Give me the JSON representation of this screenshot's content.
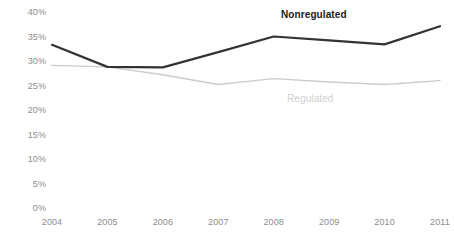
{
  "chart_data": {
    "type": "line",
    "title": "",
    "subtitle": "",
    "xlabel": "",
    "ylabel": "",
    "categories": [
      "2004",
      "2005",
      "2006",
      "2007",
      "2008",
      "2009",
      "2010",
      "2011"
    ],
    "x": [
      2004,
      2005,
      2006,
      2007,
      2008,
      2009,
      2010,
      2011
    ],
    "series": [
      {
        "name": "Nonregulated",
        "color": "#333333",
        "line_width": 2.2,
        "values": [
          33.3,
          28.8,
          28.7,
          31.8,
          35.0,
          34.2,
          33.4,
          37.1
        ]
      },
      {
        "name": "Regulated",
        "color": "#cccccc",
        "line_width": 1.4,
        "values": [
          29.1,
          28.8,
          27.2,
          25.2,
          26.4,
          25.7,
          25.2,
          26.0
        ]
      }
    ],
    "ylim": [
      0,
      40
    ],
    "ytick_values": [
      0,
      5,
      10,
      15,
      20,
      25,
      30,
      35,
      40
    ],
    "ytick_labels": [
      "0%",
      "5%",
      "10%",
      "15%",
      "20%",
      "25%",
      "30%",
      "35%",
      "40%"
    ],
    "xtick_labels": [
      "2004",
      "2005",
      "2006",
      "2007",
      "2008",
      "2009",
      "2010",
      "2011"
    ],
    "grid": false,
    "legend_position": "inline-annotations",
    "annotations": [
      {
        "text": "Nonregulated",
        "series": "Nonregulated",
        "style": "bold",
        "color": "#1a1a1a"
      },
      {
        "text": "Regulated",
        "series": "Regulated",
        "style": "normal",
        "color": "#cfcfcf"
      }
    ],
    "axis_tick_color": "#8d8d8d",
    "background_color": "#ffffff"
  }
}
